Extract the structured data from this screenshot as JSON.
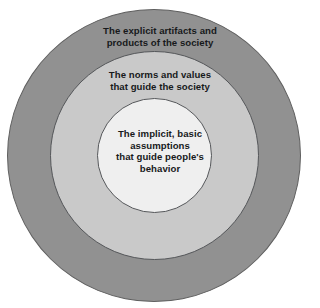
{
  "diagram": {
    "name": "culture-onion-model",
    "type": "concentric-circles",
    "background_color": "#ffffff",
    "text_color": "#17191b",
    "layers": [
      {
        "id": "outer",
        "label": "The explicit artifacts and\nproducts of the society",
        "fill_color": "#919191",
        "stroke_color": "#5f5f5f",
        "diameter_px": 294
      },
      {
        "id": "middle",
        "label": "The norms and values\nthat guide the society",
        "fill_color": "#c9c9c9",
        "stroke_color": "#55575a",
        "diameter_px": 209
      },
      {
        "id": "inner",
        "label": "The implicit, basic\nassumptions\nthat guide people's\nbehavior",
        "fill_color": "#efefef",
        "stroke_color": "#55575a",
        "diameter_px": 115
      }
    ]
  }
}
